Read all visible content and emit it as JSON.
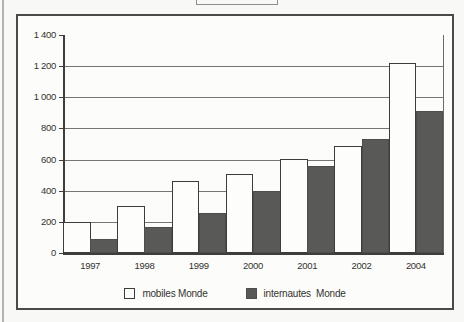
{
  "chart_data": {
    "type": "bar",
    "title": "",
    "categories": [
      "1997",
      "1998",
      "1999",
      "2000",
      "2001",
      "2002",
      "2004"
    ],
    "series": [
      {
        "name": "mobiles Monde",
        "color": "#ffffff",
        "values": [
          200,
          300,
          460,
          510,
          605,
          690,
          1220
        ]
      },
      {
        "name": "internautes  Monde",
        "color": "#595957",
        "values": [
          90,
          170,
          255,
          400,
          560,
          730,
          910
        ]
      }
    ],
    "xlabel": "",
    "ylabel": "",
    "ylim": [
      0,
      1400
    ],
    "ytick_interval": 200,
    "ytick_labels": [
      "0",
      "200",
      "400",
      "600",
      "800",
      "1 000",
      "1 200",
      "1 400"
    ],
    "grid": "horizontal",
    "legend_position": "bottom",
    "bar_colors": {
      "mobiles": "#ffffff",
      "internautes": "#595957"
    }
  }
}
